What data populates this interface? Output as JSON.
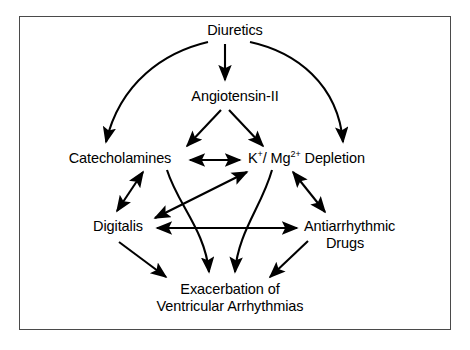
{
  "figure": {
    "border_color": "#4a4a4a",
    "stroke_color": "#000000",
    "background_color": "#ffffff"
  },
  "nodes": {
    "diuretics": {
      "label": "Diuretics"
    },
    "angiotensin": {
      "label": "Angiotensin-II"
    },
    "catecholamines": {
      "label": "Catecholamines"
    },
    "kmg": {
      "label": "K+/ Mg2+ Depletion",
      "prefix": "K",
      "sup1": "+",
      "middle": "/ Mg",
      "sup2": "2+",
      "suffix": " Depletion"
    },
    "digitalis": {
      "label": "Digitalis"
    },
    "antiarrhythmic": {
      "line1": "Antiarrhythmic",
      "line2": "Drugs"
    },
    "exacerbation": {
      "line1": "Exacerbation of",
      "line2": "Ventricular Arrhythmias"
    }
  },
  "edges": [
    {
      "from": "Diuretics",
      "to": "Catecholamines",
      "style": "curved",
      "heads": "single"
    },
    {
      "from": "Diuretics",
      "to": "Angiotensin-II",
      "style": "straight-vertical",
      "heads": "single"
    },
    {
      "from": "Diuretics",
      "to": "K+/ Mg2+ Depletion",
      "style": "curved",
      "heads": "single"
    },
    {
      "from": "Angiotensin-II",
      "to": "Catecholamines",
      "style": "straight-diagonal",
      "heads": "single"
    },
    {
      "from": "Angiotensin-II",
      "to": "K+/ Mg2+ Depletion",
      "style": "straight-diagonal",
      "heads": "single"
    },
    {
      "from": "Catecholamines",
      "to": "K+/ Mg2+ Depletion",
      "style": "straight-horizontal",
      "heads": "double"
    },
    {
      "from": "Catecholamines",
      "to": "Digitalis",
      "style": "straight-diagonal",
      "heads": "double"
    },
    {
      "from": "Digitalis",
      "to": "K+/ Mg2+ Depletion",
      "style": "straight-diagonal",
      "heads": "double"
    },
    {
      "from": "Digitalis",
      "to": "Antiarrhythmic Drugs",
      "style": "straight-horizontal",
      "heads": "double"
    },
    {
      "from": "K+/ Mg2+ Depletion",
      "to": "Antiarrhythmic Drugs",
      "style": "straight-diagonal",
      "heads": "double"
    },
    {
      "from": "Catecholamines",
      "to": "Exacerbation of Ventricular Arrhythmias",
      "style": "curved",
      "heads": "single"
    },
    {
      "from": "K+/ Mg2+ Depletion",
      "to": "Exacerbation of Ventricular Arrhythmias",
      "style": "curved",
      "heads": "single"
    },
    {
      "from": "Digitalis",
      "to": "Exacerbation of Ventricular Arrhythmias",
      "style": "straight-diagonal",
      "heads": "single"
    },
    {
      "from": "Antiarrhythmic Drugs",
      "to": "Exacerbation of Ventricular Arrhythmias",
      "style": "straight-diagonal",
      "heads": "single"
    }
  ]
}
